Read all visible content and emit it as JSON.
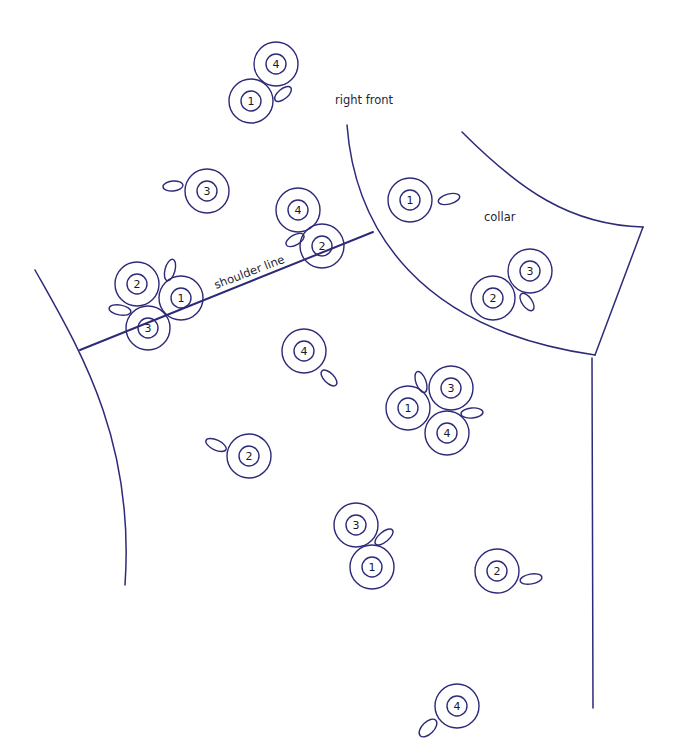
{
  "colors": {
    "line": "#2d2a78",
    "text": "#1f1f3a",
    "background": "#ffffff"
  },
  "labels": {
    "right_front": {
      "text": "right front",
      "x": 335,
      "y": 104
    },
    "collar": {
      "text": "collar",
      "x": 484,
      "y": 221
    },
    "shoulder_line": {
      "text": "shoulder line",
      "x": 216,
      "y": 289,
      "rotate": -21
    }
  },
  "outlines": {
    "armhole_curve": "M 35 270 C 80 350, 135 440, 125 585",
    "shoulder_line": "M 80 350 L 373 232",
    "right_front_neck_curve": "M 347 125 C 355 230, 420 330, 595 355",
    "collar_outer_curve": "M 462 132 C 520 190, 570 225, 643 227",
    "collar_edge": "M 643 227 L 595 355",
    "center_front_line": "M 592 358 L 593 708"
  },
  "markers": [
    {
      "id": "m1",
      "number": "4",
      "cx": 276,
      "cy": 64,
      "loop": {
        "cx": 283,
        "cy": 94,
        "rx": 10,
        "ry": 5,
        "rot": -40
      }
    },
    {
      "id": "m2",
      "number": "1",
      "cx": 251,
      "cy": 101,
      "loop": null
    },
    {
      "id": "m3",
      "number": "3",
      "cx": 207,
      "cy": 191,
      "loop": {
        "cx": 173,
        "cy": 186,
        "rx": 10,
        "ry": 5,
        "rot": -5
      }
    },
    {
      "id": "m4",
      "number": "4",
      "cx": 298,
      "cy": 210,
      "loop": {
        "cx": 295,
        "cy": 240,
        "rx": 10,
        "ry": 5,
        "rot": -30
      }
    },
    {
      "id": "m5",
      "number": "2",
      "cx": 322,
      "cy": 246,
      "loop": null
    },
    {
      "id": "m6",
      "number": "1",
      "cx": 410,
      "cy": 200,
      "loop": {
        "cx": 449,
        "cy": 199,
        "rx": 11,
        "ry": 5,
        "rot": -15
      }
    },
    {
      "id": "m7",
      "number": "3",
      "cx": 530,
      "cy": 271,
      "loop": null
    },
    {
      "id": "m8",
      "number": "2",
      "cx": 493,
      "cy": 298,
      "loop": {
        "cx": 527,
        "cy": 302,
        "rx": 5,
        "ry": 10,
        "rot": -35
      }
    },
    {
      "id": "m9",
      "number": "2",
      "cx": 137,
      "cy": 284,
      "loop": {
        "cx": 170,
        "cy": 270,
        "rx": 5,
        "ry": 11,
        "rot": 15
      }
    },
    {
      "id": "m10",
      "number": "1",
      "cx": 181,
      "cy": 298,
      "loop": null
    },
    {
      "id": "m11",
      "number": "3",
      "cx": 148,
      "cy": 328,
      "loop": {
        "cx": 120,
        "cy": 310,
        "rx": 11,
        "ry": 5,
        "rot": 10
      }
    },
    {
      "id": "m12",
      "number": "4",
      "cx": 304,
      "cy": 351,
      "loop": {
        "cx": 329,
        "cy": 378,
        "rx": 5,
        "ry": 10,
        "rot": -45
      }
    },
    {
      "id": "m13",
      "number": "3",
      "cx": 451,
      "cy": 388,
      "loop": {
        "cx": 421,
        "cy": 382,
        "rx": 5,
        "ry": 11,
        "rot": -20
      }
    },
    {
      "id": "m14",
      "number": "1",
      "cx": 408,
      "cy": 408,
      "loop": null
    },
    {
      "id": "m15",
      "number": "4",
      "cx": 447,
      "cy": 433,
      "loop": {
        "cx": 472,
        "cy": 413,
        "rx": 11,
        "ry": 5,
        "rot": -5
      }
    },
    {
      "id": "m16",
      "number": "2",
      "cx": 249,
      "cy": 456,
      "loop": {
        "cx": 216,
        "cy": 445,
        "rx": 11,
        "ry": 5,
        "rot": 25
      }
    },
    {
      "id": "m17",
      "number": "3",
      "cx": 356,
      "cy": 525,
      "loop": {
        "cx": 384,
        "cy": 537,
        "rx": 11,
        "ry": 5,
        "rot": -40
      }
    },
    {
      "id": "m18",
      "number": "1",
      "cx": 372,
      "cy": 567,
      "loop": null
    },
    {
      "id": "m19",
      "number": "2",
      "cx": 497,
      "cy": 571,
      "loop": {
        "cx": 531,
        "cy": 579,
        "rx": 11,
        "ry": 5,
        "rot": -10
      }
    },
    {
      "id": "m20",
      "number": "4",
      "cx": 457,
      "cy": 706,
      "loop": {
        "cx": 428,
        "cy": 728,
        "rx": 11,
        "ry": 6,
        "rot": -45
      }
    }
  ],
  "marker_style": {
    "outer_r": 22,
    "inner_r": 10
  }
}
